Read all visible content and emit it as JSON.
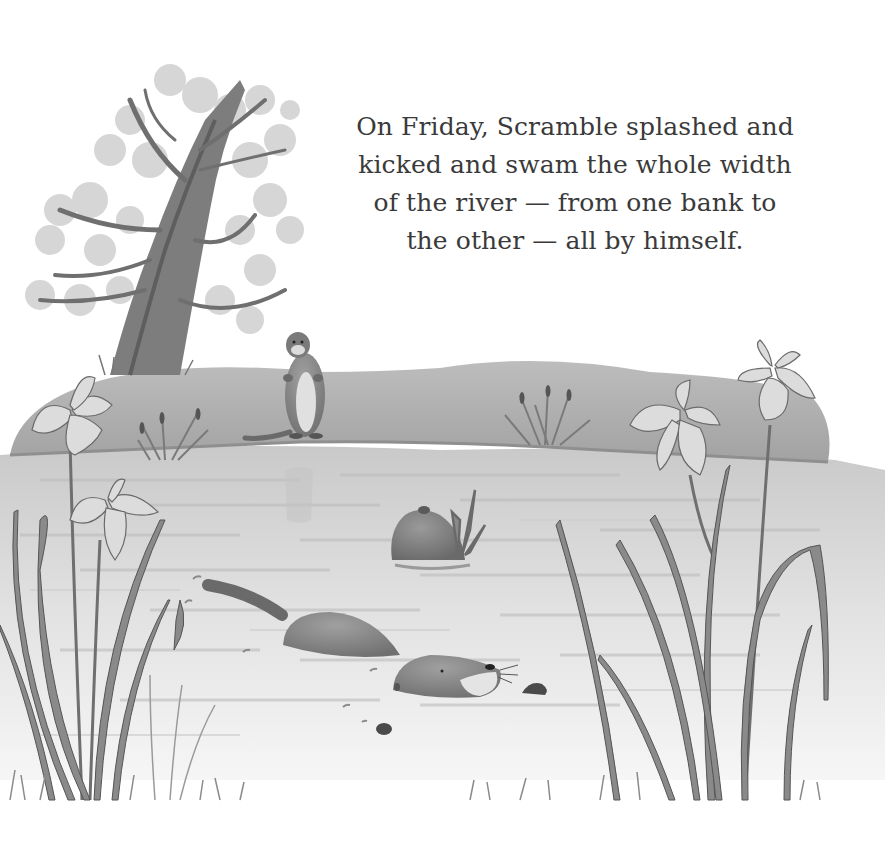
{
  "page": {
    "style": "grayscale pencil and watercolor illustration",
    "background_color": "#ffffff",
    "ink_color": "#3a3a3a"
  },
  "story": {
    "lines": [
      "On Friday, Scramble splashed and",
      "kicked and swam the whole width",
      "of the river — from one bank to",
      "the other — all by himself."
    ]
  },
  "illustration": {
    "elements": [
      "tree-on-far-bank",
      "standing-otter-on-bank",
      "far-riverbank",
      "cattails",
      "river-water",
      "rock-with-frog-and-reeds",
      "swimming-otter-scramble",
      "splash-droplets",
      "iris-flowers-left",
      "iris-flowers-right",
      "grass-foreground"
    ]
  }
}
